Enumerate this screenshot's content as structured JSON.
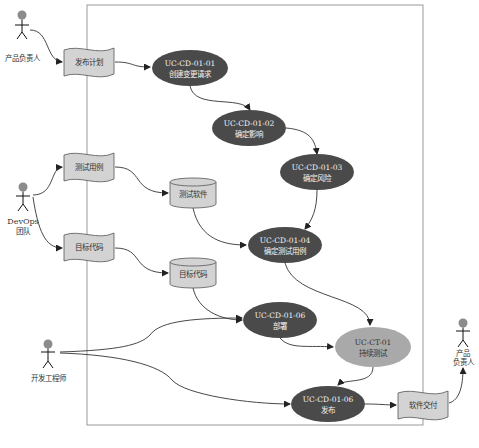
{
  "diagram": {
    "type": "use-case-flow",
    "boundary": {
      "x": 87,
      "y": 5,
      "w": 336,
      "h": 420
    },
    "colors": {
      "use_case_fill": "#4a4a4a",
      "highlight_use_case_fill": "#a9a9a9",
      "document_fill": "#d3d3d3",
      "database_fill": "#d3d3d3",
      "actor_head": "#8c8c8c",
      "boundary_stroke": "#999999",
      "edge": "#333333"
    },
    "actors": [
      {
        "id": "product-owner-1",
        "label_lines": [
          "产品负责人"
        ],
        "x": 27,
        "y": 30
      },
      {
        "id": "devops-team",
        "label_lines": [
          "DevOps",
          "团队"
        ],
        "x": 23,
        "y": 195
      },
      {
        "id": "developer",
        "label_lines": [
          "开发工程师"
        ],
        "x": 48,
        "y": 352
      },
      {
        "id": "product-owner-2",
        "label_lines": [
          "产品",
          "负责人"
        ],
        "x": 463,
        "y": 330
      }
    ],
    "documents": [
      {
        "id": "release-plan",
        "label": "发布计划",
        "x": 64,
        "y": 47,
        "w": 50,
        "h": 28
      },
      {
        "id": "test-cases",
        "label": "测试用例",
        "x": 64,
        "y": 153,
        "w": 50,
        "h": 28
      },
      {
        "id": "target-code-doc",
        "label": "目标代码",
        "x": 64,
        "y": 233,
        "w": 50,
        "h": 28
      },
      {
        "id": "software-delivery",
        "label": "软件交付",
        "x": 398,
        "y": 390,
        "w": 50,
        "h": 28
      }
    ],
    "databases": [
      {
        "id": "test-software",
        "label": "测试软件",
        "x": 170,
        "y": 178,
        "w": 46,
        "h": 30
      },
      {
        "id": "target-code-db",
        "label": "目标代码",
        "x": 170,
        "y": 258,
        "w": 46,
        "h": 30
      }
    ],
    "use_cases": [
      {
        "id": "uc-cd-01-01",
        "code": "UC-CD-01-01",
        "title": "创建变更请求",
        "cx": 190,
        "cy": 68,
        "rx": 38,
        "ry": 18,
        "highlight": false
      },
      {
        "id": "uc-cd-01-02",
        "code": "UC-CD-01-02",
        "title": "确定影响",
        "cx": 249,
        "cy": 128,
        "rx": 37,
        "ry": 18,
        "highlight": false
      },
      {
        "id": "uc-cd-01-03",
        "code": "UC-CD-01-03",
        "title": "确定风险",
        "cx": 317,
        "cy": 172,
        "rx": 37,
        "ry": 18,
        "highlight": false
      },
      {
        "id": "uc-cd-01-04",
        "code": "UC-CD-01-04",
        "title": "确定测试用例",
        "cx": 285,
        "cy": 245,
        "rx": 37,
        "ry": 18,
        "highlight": false
      },
      {
        "id": "uc-cd-01-06-deploy",
        "code": "UC-CD-01-06",
        "title": "部署",
        "cx": 280,
        "cy": 320,
        "rx": 37,
        "ry": 18,
        "highlight": false
      },
      {
        "id": "uc-ct-01",
        "code": "UC-CT-01",
        "title": "持续测试",
        "cx": 373,
        "cy": 347,
        "rx": 38,
        "ry": 20,
        "highlight": true
      },
      {
        "id": "uc-cd-01-06-release",
        "code": "UC-CD-01-06",
        "title": "发布",
        "cx": 328,
        "cy": 404,
        "rx": 37,
        "ry": 18,
        "highlight": false
      }
    ]
  }
}
